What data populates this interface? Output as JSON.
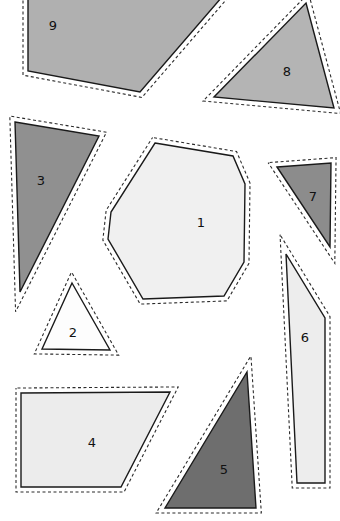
{
  "canvas": {
    "width": 340,
    "height": 521,
    "background_color": "#ffffff",
    "description": "Nine numbered polygons with dashed selection outlines on a white background"
  },
  "style": {
    "outline_color": "#1a1a1a",
    "outline_width": 1.4,
    "dash_color": "#2b2b2b",
    "dash_width": 1.1,
    "dash_pattern": "3,2.5",
    "dash_offset": 4,
    "label_color": "#111111",
    "label_font_size": 13
  },
  "shapes": [
    {
      "id": "shape-1",
      "label": "1",
      "fill": "#f0f0f0",
      "label_x": 201,
      "label_y": 223,
      "points": "155,143 233,156 245,184 244,262 224,296 143,299 108,239 111,212"
    },
    {
      "id": "shape-2",
      "label": "2",
      "fill": "#fdfdfd",
      "label_x": 73,
      "label_y": 333,
      "points": "72,283 110,350 42,349"
    },
    {
      "id": "shape-3",
      "label": "3",
      "fill": "#909090",
      "label_x": 41,
      "label_y": 181,
      "points": "15,122 99,136 20,292"
    },
    {
      "id": "shape-4",
      "label": "4",
      "fill": "#ececec",
      "label_x": 92,
      "label_y": 443,
      "points": "21,393 170,392 121,487 21,487"
    },
    {
      "id": "shape-5",
      "label": "5",
      "fill": "#6e6e6e",
      "label_x": 224,
      "label_y": 470,
      "points": "247,372 256,508 165,508"
    },
    {
      "id": "shape-6",
      "label": "6",
      "fill": "#ededed",
      "label_x": 305,
      "label_y": 338,
      "points": "286,254 325,318 325,483 297,483"
    },
    {
      "id": "shape-7",
      "label": "7",
      "fill": "#8c8c8c",
      "label_x": 313,
      "label_y": 197,
      "points": "277,167 331,163 330,247"
    },
    {
      "id": "shape-8",
      "label": "8",
      "fill": "#b4b4b4",
      "label_x": 287,
      "label_y": 72,
      "points": "306,3 334,108 214,97"
    },
    {
      "id": "shape-9",
      "label": "9",
      "fill": "#b0b0b0",
      "label_x": 53,
      "label_y": 26,
      "points": "28,-10 228,-10 140,92 28,71"
    }
  ]
}
